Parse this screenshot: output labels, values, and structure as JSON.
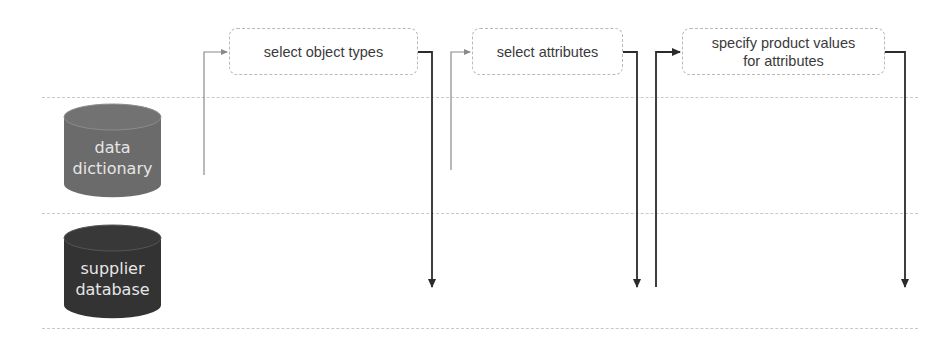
{
  "diagram": {
    "lanes": [
      {
        "id": "data-dictionary",
        "label_line1": "data",
        "label_line2": "dictionary",
        "fill": "#6b6b6b"
      },
      {
        "id": "supplier-database",
        "label_line1": "supplier",
        "label_line2": "database",
        "fill": "#333333"
      }
    ],
    "steps": [
      {
        "id": "select-object-types",
        "label": "select object types",
        "input_from": "data dictionary",
        "output_to": "supplier database"
      },
      {
        "id": "select-attributes",
        "label": "select attributes",
        "input_from": "data dictionary",
        "output_to": "supplier database"
      },
      {
        "id": "specify-product-values",
        "label_line1": "specify product values",
        "label_line2": "for attributes",
        "input_from": "supplier database",
        "output_to": "supplier database"
      }
    ],
    "colors": {
      "input_line_light": "#8a8a8a",
      "line_dark": "#2b2b2b",
      "separator": "#c8c8c8",
      "box_border": "#b9b9b9",
      "text": "#3a3a3a"
    }
  }
}
